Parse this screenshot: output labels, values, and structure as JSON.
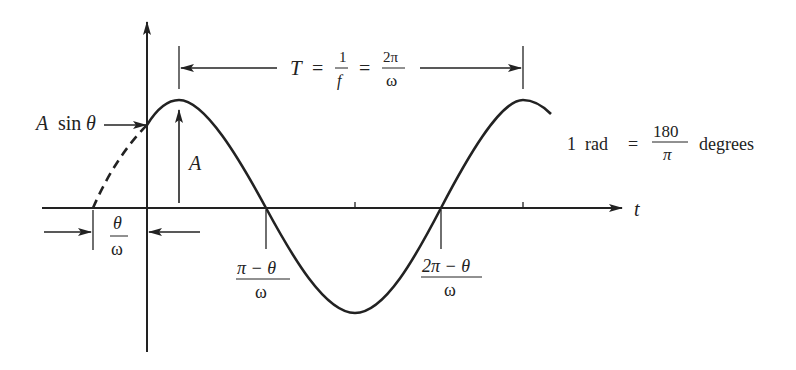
{
  "diagram": {
    "axes": {
      "x_label": "t"
    },
    "labels": {
      "period": {
        "T": "T",
        "eq1": "=",
        "f_num": "1",
        "f_den": "f",
        "eq2": "=",
        "w_num": "2π",
        "w_den": "ω"
      },
      "a_sin_theta": {
        "A": "A",
        "sin": "sin",
        "theta": "θ"
      },
      "amplitude": "A",
      "phase_offset": {
        "num": "θ",
        "den": "ω"
      },
      "zero1": {
        "num": "π − θ",
        "den": "ω"
      },
      "zero2": {
        "num": "2π − θ",
        "den": "ω"
      },
      "rad_conversion": {
        "lhs": "1  rad",
        "eq": "=",
        "num": "180",
        "den": "π",
        "unit": "degrees"
      }
    },
    "colors": {
      "ink": "#222222",
      "background": "#ffffff"
    }
  }
}
